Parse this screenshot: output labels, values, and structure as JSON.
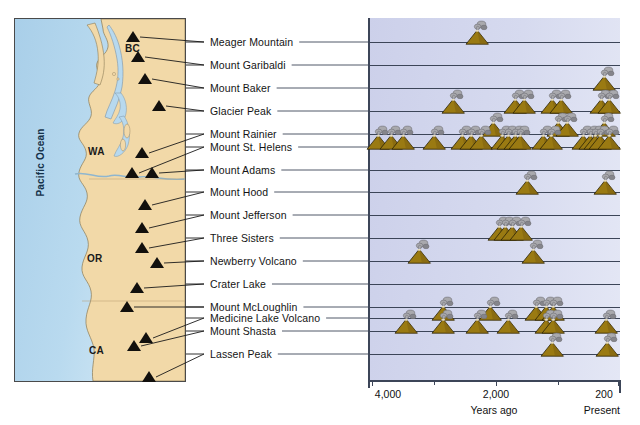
{
  "map": {
    "ocean_label": "Pacific Ocean",
    "region_labels": [
      {
        "name": "BC",
        "x": 111,
        "y": 25
      },
      {
        "name": "WA",
        "x": 74,
        "y": 128
      },
      {
        "name": "OR",
        "x": 73,
        "y": 235
      },
      {
        "name": "CA",
        "x": 75,
        "y": 327
      }
    ],
    "colors": {
      "ocean": "#a9cfe9",
      "land": "#f2d9a8",
      "border": "#4a4a4a",
      "volcano_marker": "#12100d"
    },
    "volcano_markers": [
      {
        "name": "Meager Mountain",
        "x": 119,
        "y": 24
      },
      {
        "name": "Mount Garibaldi",
        "x": 124,
        "y": 44
      },
      {
        "name": "Mount Baker",
        "x": 131,
        "y": 66
      },
      {
        "name": "Glacier Peak",
        "x": 145,
        "y": 93
      },
      {
        "name": "Mount Rainier",
        "x": 128,
        "y": 140
      },
      {
        "name": "Mount St. Helens",
        "x": 118,
        "y": 160
      },
      {
        "name": "Mount Adams",
        "x": 138,
        "y": 160
      },
      {
        "name": "Mount Hood",
        "x": 131,
        "y": 192
      },
      {
        "name": "Mount Jefferson",
        "x": 128,
        "y": 215
      },
      {
        "name": "Three Sisters",
        "x": 128,
        "y": 235
      },
      {
        "name": "Newberry Volcano",
        "x": 143,
        "y": 250
      },
      {
        "name": "Crater Lake",
        "x": 123,
        "y": 275
      },
      {
        "name": "Mount McLoughlin",
        "x": 113,
        "y": 294
      },
      {
        "name": "Medicine Lake Volcano",
        "x": 132,
        "y": 325
      },
      {
        "name": "Mount Shasta",
        "x": 120,
        "y": 333
      },
      {
        "name": "Lassen Peak",
        "x": 135,
        "y": 364
      }
    ]
  },
  "chart_data": {
    "type": "timeline",
    "xlabel": "Years ago",
    "ylabel": "",
    "grid": true,
    "legend": "none",
    "axis": {
      "ticks": [
        {
          "label": "4,000",
          "value": 4000,
          "px": 372
        },
        {
          "label": "2,000",
          "value": 2000,
          "px": 496
        },
        {
          "label": "200",
          "value": 200,
          "px": 618
        }
      ],
      "end_label": "Present",
      "xlim": [
        4000,
        0
      ],
      "note": "Time runs right-to-left; right edge is the present day"
    },
    "row_label_x": 210,
    "rows": [
      {
        "label": "Meager Mountain",
        "y": 42,
        "eruptions": [
          2300
        ]
      },
      {
        "label": "Mount Garibaldi",
        "y": 65,
        "eruptions": []
      },
      {
        "label": "Mount Baker",
        "y": 88,
        "eruptions": [
          260
        ]
      },
      {
        "label": "Glacier Peak",
        "y": 111,
        "eruptions": [
          2700,
          1700,
          1550,
          1100,
          950,
          300,
          180
        ]
      },
      {
        "label": "Mount Rainier",
        "y": 134,
        "eruptions": [
          2050,
          1000,
          850,
          260
        ]
      },
      {
        "label": "Mount St. Helens",
        "y": 147,
        "eruptions": [
          3900,
          3700,
          3500,
          3000,
          2550,
          2400,
          2250,
          1900,
          1800,
          1700,
          1620,
          1250,
          1120,
          600,
          480,
          400,
          320,
          180
        ]
      },
      {
        "label": "Mount Adams",
        "y": 170,
        "eruptions": []
      },
      {
        "label": "Mount Hood",
        "y": 192,
        "eruptions": [
          1500,
          240
        ]
      },
      {
        "label": "Mount Jefferson",
        "y": 215,
        "eruptions": []
      },
      {
        "label": "Three Sisters",
        "y": 238,
        "eruptions": [
          1950,
          1850,
          1750,
          1600
        ]
      },
      {
        "label": "Newberry Volcano",
        "y": 261,
        "eruptions": [
          3250,
          1400
        ]
      },
      {
        "label": "Crater Lake",
        "y": 284,
        "eruptions": []
      },
      {
        "label": "Mount McLoughlin",
        "y": 307,
        "eruptions": []
      },
      {
        "label": "Medicine Lake Volcano",
        "y": 318,
        "eruptions": [
          2850,
          2100,
          1350,
          1200,
          1080
        ]
      },
      {
        "label": "Mount Shasta",
        "y": 331,
        "eruptions": [
          3450,
          2850,
          2300,
          1800,
          1200,
          1080,
          220
        ]
      },
      {
        "label": "Lassen Peak",
        "y": 354,
        "eruptions": [
          1100,
          210
        ]
      }
    ]
  },
  "colors": {
    "panel_bg": "#ccd0ea",
    "rowline": "#3c4558",
    "volcano_cone": "#9a7a12",
    "volcano_cone_dark": "#7e6110",
    "smoke": "#a9a9ad",
    "smoke_dark": "#85858b",
    "text": "#111111"
  }
}
